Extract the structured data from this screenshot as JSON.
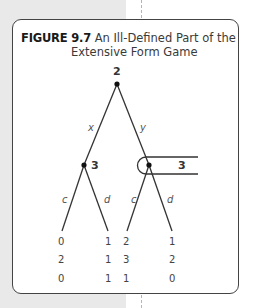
{
  "figure": {
    "number": "FIGURE 9.7",
    "title_line1": "An Ill-Defined Part of the",
    "title_line2": "Extensive Form Game"
  },
  "tree": {
    "root": {
      "player": "2"
    },
    "actions_root": [
      "x",
      "y"
    ],
    "left_node": {
      "player": "3"
    },
    "right_node": {
      "player": "3",
      "info_set_label": "3"
    },
    "actions_left": [
      "c",
      "d"
    ],
    "actions_right": [
      "c",
      "d"
    ],
    "payoffs": [
      {
        "leaf": "x-c",
        "values": [
          "0",
          "2",
          "0"
        ]
      },
      {
        "leaf": "x-d",
        "values": [
          "1",
          "1",
          "1"
        ]
      },
      {
        "leaf": "y-c",
        "values": [
          "2",
          "3",
          "1"
        ]
      },
      {
        "leaf": "y-d",
        "values": [
          "1",
          "2",
          "0"
        ]
      }
    ]
  },
  "colors": {
    "line": "#333333",
    "background_gray": "#e9e9e9"
  }
}
